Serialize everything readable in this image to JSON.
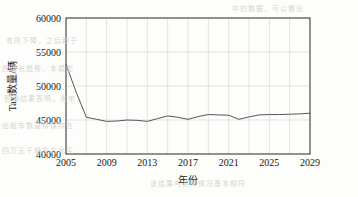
{
  "chart_data": {
    "type": "line",
    "title": "",
    "xlabel": "年份",
    "ylabel": "Taxi数量/辆",
    "xlim": [
      2005,
      2029
    ],
    "ylim": [
      40000,
      60000
    ],
    "grid": true,
    "legend": "none",
    "x_ticks": [
      "2005",
      "2009",
      "2013",
      "2017",
      "2021",
      "2025",
      "2029"
    ],
    "x_tick_values": [
      2005,
      2009,
      2013,
      2017,
      2021,
      2025,
      2029
    ],
    "y_ticks": [
      "40000",
      "45000",
      "50000",
      "55000",
      "60000"
    ],
    "y_tick_values": [
      40000,
      45000,
      50000,
      55000,
      60000
    ],
    "x": [
      2005,
      2006,
      2007,
      2008,
      2009,
      2010,
      2011,
      2012,
      2013,
      2014,
      2015,
      2016,
      2017,
      2018,
      2019,
      2020,
      2021,
      2022,
      2023,
      2024,
      2025,
      2026,
      2027,
      2028,
      2029
    ],
    "series": [
      {
        "name": "Taxi数量",
        "values": [
          53200,
          49100,
          45400,
          45100,
          44800,
          44850,
          45000,
          44950,
          44800,
          45200,
          45600,
          45400,
          45100,
          45500,
          45800,
          45750,
          45700,
          45100,
          45450,
          45750,
          45800,
          45800,
          45850,
          45900,
          46000
        ]
      }
    ]
  },
  "bleed_text": {
    "lines": [
      "中的数据，可以看出",
      "有所下降，之后趋于",
      "的增长趋势。本模型",
      "预测结果表明，未来",
      "出租车数量将保持在",
      "四万五千辆左右水平",
      "该结果与实际情况基本相符"
    ]
  }
}
